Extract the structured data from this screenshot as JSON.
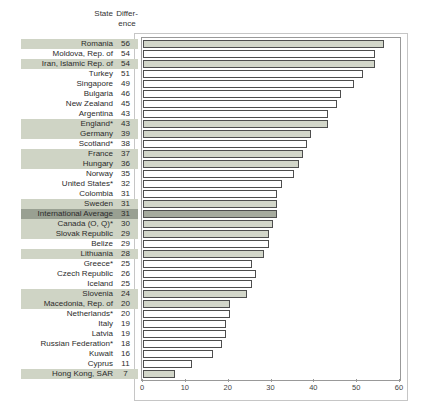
{
  "header": {
    "state_label": "State",
    "difference_label_line1": "Differ-",
    "difference_label_line2": "ence"
  },
  "colors": {
    "highlight_band": "#cfd4c5",
    "average_band": "#99a092",
    "bar_highlight_fill": "#d2d6c9",
    "bar_average_fill": "#a6ab9e",
    "bar_plain_fill": "#ffffff",
    "bar_border": "#4d4d4d",
    "plot_border": "#999999",
    "outer_border": "#c6c6c6"
  },
  "chart_data": {
    "type": "bar",
    "orientation": "horizontal",
    "title": "",
    "xlabel": "",
    "ylabel": "State",
    "value_column_label": "Difference",
    "xlim": [
      0,
      60
    ],
    "x_ticks": [
      0,
      10,
      20,
      30,
      40,
      50,
      60
    ],
    "grid": false,
    "legend": false,
    "rows": [
      {
        "label": "Romania",
        "value": 56,
        "style": "highlight"
      },
      {
        "label": "Moldova, Rep. of",
        "value": 54,
        "style": "plain"
      },
      {
        "label": "Iran, Islamic Rep. of",
        "value": 54,
        "style": "highlight"
      },
      {
        "label": "Turkey",
        "value": 51,
        "style": "plain"
      },
      {
        "label": "Singapore",
        "value": 49,
        "style": "plain"
      },
      {
        "label": "Bulgaria",
        "value": 46,
        "style": "plain"
      },
      {
        "label": "New Zealand",
        "value": 45,
        "style": "plain"
      },
      {
        "label": "Argentina",
        "value": 43,
        "style": "plain"
      },
      {
        "label": "England*",
        "value": 43,
        "style": "highlight"
      },
      {
        "label": "Germany",
        "value": 39,
        "style": "highlight"
      },
      {
        "label": "Scotland*",
        "value": 38,
        "style": "plain"
      },
      {
        "label": "France",
        "value": 37,
        "style": "highlight"
      },
      {
        "label": "Hungary",
        "value": 36,
        "style": "highlight"
      },
      {
        "label": "Norway",
        "value": 35,
        "style": "plain"
      },
      {
        "label": "United States*",
        "value": 32,
        "style": "plain"
      },
      {
        "label": "Colombia",
        "value": 31,
        "style": "plain"
      },
      {
        "label": "Sweden",
        "value": 31,
        "style": "highlight"
      },
      {
        "label": "International Average",
        "value": 31,
        "style": "average"
      },
      {
        "label": "Canada (O, Q)*",
        "value": 30,
        "style": "highlight"
      },
      {
        "label": "Slovak Republic",
        "value": 29,
        "style": "highlight"
      },
      {
        "label": "Belize",
        "value": 29,
        "style": "plain"
      },
      {
        "label": "Lithuania",
        "value": 28,
        "style": "highlight"
      },
      {
        "label": "Greece*",
        "value": 25,
        "style": "plain"
      },
      {
        "label": "Czech Republic",
        "value": 26,
        "style": "plain"
      },
      {
        "label": "Iceland",
        "value": 25,
        "style": "plain"
      },
      {
        "label": "Slovenia",
        "value": 24,
        "style": "highlight"
      },
      {
        "label": "Macedonia, Rep. of",
        "value": 20,
        "style": "highlight"
      },
      {
        "label": "Netherlands*",
        "value": 20,
        "style": "plain"
      },
      {
        "label": "Italy",
        "value": 19,
        "style": "plain"
      },
      {
        "label": "Latvia",
        "value": 19,
        "style": "plain"
      },
      {
        "label": "Russian Federation*",
        "value": 18,
        "style": "plain"
      },
      {
        "label": "Kuwait",
        "value": 16,
        "style": "plain"
      },
      {
        "label": "Cyprus",
        "value": 11,
        "style": "plain"
      },
      {
        "label": "Hong Kong, SAR",
        "value": 7,
        "style": "highlight"
      }
    ]
  }
}
